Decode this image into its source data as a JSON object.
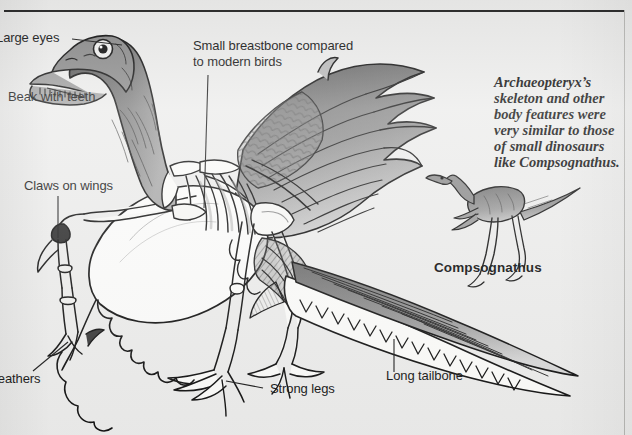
{
  "figure": {
    "background_color": "#ececeb",
    "ink_color": "#1b1b1b"
  },
  "callouts": [
    {
      "id": "large-eyes",
      "text": "Large eyes"
    },
    {
      "id": "beak-with-teeth",
      "text": "Beak with teeth"
    },
    {
      "id": "claws-on-wings",
      "text": "Claws on wings"
    },
    {
      "id": "feathers",
      "text": "Feathers"
    },
    {
      "id": "small-breastbone",
      "line1": "Small breastbone compared",
      "line2": "to modern birds"
    },
    {
      "id": "strong-legs",
      "text": "Strong legs"
    },
    {
      "id": "long-tailbone",
      "text": "Long tailbone"
    }
  ],
  "caption": {
    "line1": "Archaeopteryx’s",
    "line2": "skeleton and other",
    "line3": "body features were",
    "line4": "very similar to those",
    "line5": "of small dinosaurs",
    "line6": "like Compsognathus."
  },
  "inset": {
    "species_label": "Compsognathus"
  }
}
